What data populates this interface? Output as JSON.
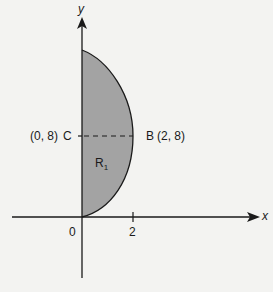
{
  "diagram": {
    "type": "region-on-axes",
    "axes": {
      "x_label": "x",
      "y_label": "y",
      "origin_label": "0",
      "x_ticks": [
        "2"
      ]
    },
    "points": {
      "C": {
        "name": "C",
        "coords": "(0, 8)"
      },
      "B": {
        "name": "B",
        "coords": "(2, 8)"
      }
    },
    "region": {
      "label": "R",
      "subscript": "1",
      "fill": "#a0a0a0"
    },
    "colors": {
      "stroke": "#1a1a1a",
      "background": "#f3f3f1"
    }
  }
}
